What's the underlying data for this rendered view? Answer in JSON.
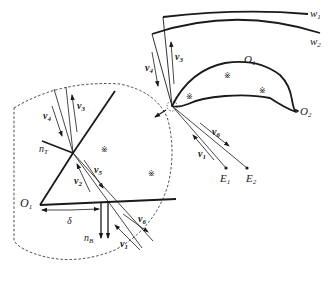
{
  "diagram": {
    "type": "stent-skin interaction zoom diagram",
    "colors": {
      "line": "#1a1a1a",
      "background": "#ffffff"
    },
    "labels": {
      "w1": {
        "base": "w",
        "sub": "1"
      },
      "w2": {
        "base": "w",
        "sub": "2"
      },
      "O1_main": {
        "base": "O",
        "sub": "1"
      },
      "O2": {
        "base": "O",
        "sub": "2"
      },
      "O1_zoom": {
        "base": "O",
        "sub": "1"
      },
      "E1": {
        "base": "E",
        "sub": "1"
      },
      "E2": {
        "base": "E",
        "sub": "2"
      },
      "nT": {
        "base": "n",
        "sub": "T"
      },
      "nB": {
        "base": "n",
        "sub": "B"
      },
      "delta": "δ",
      "v1_main": {
        "base": "v",
        "sub": "1"
      },
      "v6_main": {
        "base": "v",
        "sub": "6"
      },
      "v3_main": {
        "base": "v",
        "sub": "3"
      },
      "v4_main": {
        "base": "v",
        "sub": "4"
      },
      "v1_zoom": {
        "base": "v",
        "sub": "1"
      },
      "v2_zoom": {
        "base": "v",
        "sub": "2"
      },
      "v3_zoom": {
        "base": "v",
        "sub": "3"
      },
      "v4_zoom": {
        "base": "v",
        "sub": "4"
      },
      "v5_zoom": {
        "base": "v",
        "sub": "5"
      },
      "v6_zoom": {
        "base": "v",
        "sub": "6"
      },
      "hatch": "※"
    }
  }
}
